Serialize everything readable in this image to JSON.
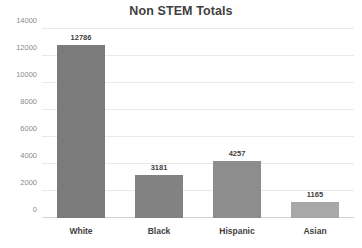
{
  "chart_data": {
    "type": "bar",
    "title": "Non STEM Totals",
    "xlabel": "",
    "ylabel": "",
    "categories": [
      "White",
      "Black",
      "Hispanic",
      "Asian"
    ],
    "values": [
      12786,
      3181,
      4257,
      1165
    ],
    "value_labels": [
      "12786",
      "3181",
      "4257",
      "1165"
    ],
    "ylim": [
      0,
      14000
    ],
    "yticks": [
      0,
      2000,
      4000,
      6000,
      8000,
      10000,
      12000,
      14000
    ],
    "ytick_labels": [
      "0",
      "2000",
      "4000",
      "6000",
      "8000",
      "10000",
      "12000",
      "14000"
    ],
    "grid": true,
    "legend": false,
    "bar_colors": [
      "#7b7b7b",
      "#828282",
      "#8d8d8d",
      "#a8a8a8"
    ]
  },
  "colors": {
    "title_text": "#3f3f3f",
    "tick_text": "#8a8a8a",
    "gridline": "#e9e9e9",
    "background": "#ffffff"
  }
}
